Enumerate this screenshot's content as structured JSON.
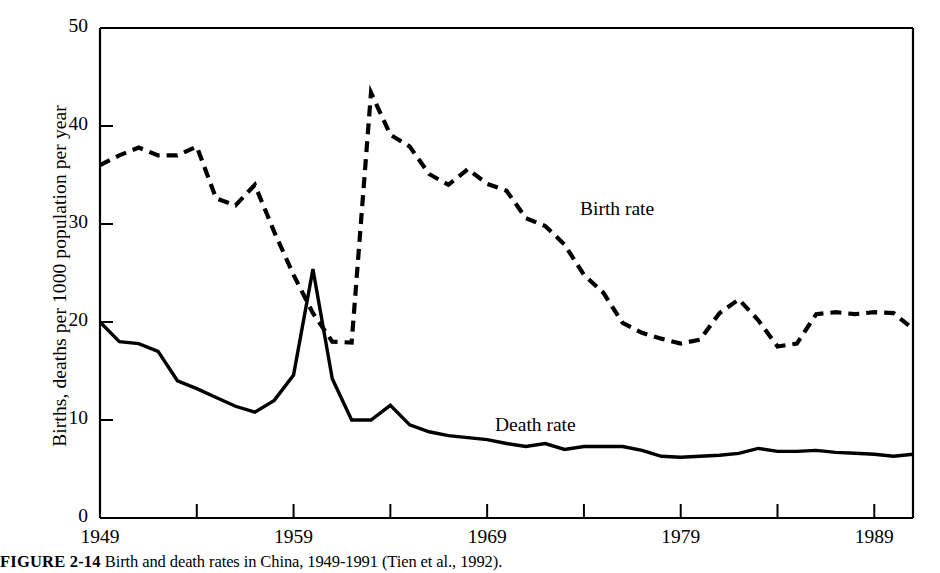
{
  "figure": {
    "caption_label": "FIGURE 2-14",
    "caption_text": "Birth and death rates in China, 1949-1991 (Tien et al., 1992)."
  },
  "annotations": {
    "birth_rate_label": "Birth rate",
    "death_rate_label": "Death rate"
  },
  "chart_data": {
    "type": "line",
    "title": "",
    "xlabel": "",
    "ylabel": "Births, deaths per 1000 population per year",
    "xlim": [
      1949,
      1991
    ],
    "ylim": [
      0,
      50
    ],
    "grid": false,
    "legend_position": "inline-annotation",
    "x_ticks_major": [
      1949,
      1959,
      1969,
      1979,
      1989
    ],
    "x_tick_labels": [
      "1949",
      "1959",
      "1969",
      "1979",
      "1989"
    ],
    "x_ticks_minor": [
      1954,
      1964,
      1974,
      1984
    ],
    "y_ticks": [
      0,
      10,
      20,
      30,
      40,
      50
    ],
    "y_tick_labels": [
      "0",
      "10",
      "20",
      "30",
      "40",
      "50"
    ],
    "x": [
      1949,
      1950,
      1951,
      1952,
      1953,
      1954,
      1955,
      1956,
      1957,
      1958,
      1959,
      1960,
      1961,
      1962,
      1963,
      1964,
      1965,
      1966,
      1967,
      1968,
      1969,
      1970,
      1971,
      1972,
      1973,
      1974,
      1975,
      1976,
      1977,
      1978,
      1979,
      1980,
      1981,
      1982,
      1983,
      1984,
      1985,
      1986,
      1987,
      1988,
      1989,
      1990,
      1991
    ],
    "series": [
      {
        "name": "Birth rate",
        "style": "dashed",
        "color": "#000000",
        "values": [
          36.0,
          37.0,
          37.8,
          37.0,
          37.0,
          37.9,
          32.6,
          31.9,
          34.0,
          29.2,
          24.8,
          20.9,
          18.0,
          17.9,
          43.4,
          39.1,
          37.9,
          35.1,
          34.0,
          35.6,
          34.1,
          33.4,
          30.6,
          29.8,
          27.9,
          24.8,
          23.0,
          19.9,
          18.9,
          18.3,
          17.8,
          18.2,
          20.9,
          22.3,
          20.2,
          17.5,
          17.8,
          20.8,
          21.0,
          20.8,
          21.0,
          20.9,
          19.3
        ]
      },
      {
        "name": "Death rate",
        "style": "solid",
        "color": "#000000",
        "values": [
          20.0,
          18.0,
          17.8,
          17.0,
          14.0,
          13.2,
          12.3,
          11.4,
          10.8,
          12.0,
          14.6,
          25.4,
          14.2,
          10.0,
          10.0,
          11.5,
          9.5,
          8.8,
          8.4,
          8.2,
          8.0,
          7.6,
          7.3,
          7.6,
          7.0,
          7.3,
          7.3,
          7.3,
          6.9,
          6.3,
          6.2,
          6.3,
          6.4,
          6.6,
          7.1,
          6.8,
          6.8,
          6.9,
          6.7,
          6.6,
          6.5,
          6.3,
          6.5
        ]
      }
    ]
  }
}
